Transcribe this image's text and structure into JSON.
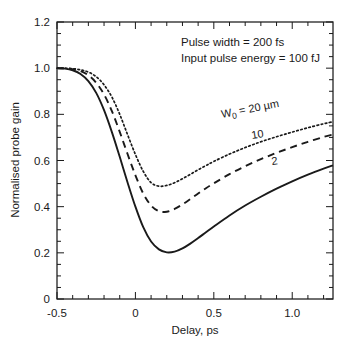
{
  "chart_data": {
    "type": "line",
    "title": "",
    "xlabel": "Delay, ps",
    "ylabel": "Normalised probe gain",
    "xlim": [
      -0.5,
      1.26
    ],
    "ylim": [
      0,
      1.2
    ],
    "xticks": [
      -0.5,
      0,
      0.5,
      1.0
    ],
    "xticklabels": [
      "-0.5",
      "0",
      "0.5",
      "1.0"
    ],
    "yticks": [
      0,
      0.2,
      0.4,
      0.6,
      0.8,
      1.0,
      1.2
    ],
    "yticklabels": [
      "0",
      "0.2",
      "0.4",
      "0.6",
      "0.8",
      "1.0",
      "1.2"
    ],
    "grid": false,
    "legend_position": "inline-curve-labels",
    "annotations": [
      "Pulse width = 200 fs",
      "Input pulse energy = 100 fJ"
    ],
    "series": [
      {
        "name": "W0 = 20 um",
        "label": "W",
        "label_sub": "0",
        "label_rest": " = 20 µm",
        "style": "dotted",
        "color": "#1a1a1a",
        "x": [
          -0.5,
          -0.45,
          -0.4,
          -0.35,
          -0.3,
          -0.25,
          -0.2,
          -0.15,
          -0.1,
          -0.05,
          0.0,
          0.05,
          0.1,
          0.15,
          0.2,
          0.25,
          0.3,
          0.35,
          0.4,
          0.45,
          0.5,
          0.6,
          0.7,
          0.8,
          0.9,
          1.0,
          1.1,
          1.2,
          1.26
        ],
        "y": [
          1.0,
          1.0,
          0.998,
          0.993,
          0.983,
          0.963,
          0.928,
          0.875,
          0.8,
          0.712,
          0.626,
          0.553,
          0.504,
          0.489,
          0.492,
          0.504,
          0.521,
          0.54,
          0.56,
          0.578,
          0.596,
          0.628,
          0.656,
          0.681,
          0.703,
          0.723,
          0.742,
          0.759,
          0.768
        ]
      },
      {
        "name": "W0 = 10 um",
        "label": "10",
        "style": "dashed",
        "color": "#1a1a1a",
        "x": [
          -0.5,
          -0.45,
          -0.4,
          -0.35,
          -0.3,
          -0.25,
          -0.2,
          -0.15,
          -0.1,
          -0.05,
          0.0,
          0.05,
          0.1,
          0.15,
          0.2,
          0.25,
          0.3,
          0.35,
          0.4,
          0.45,
          0.5,
          0.6,
          0.7,
          0.8,
          0.9,
          1.0,
          1.1,
          1.2,
          1.26
        ],
        "y": [
          1.0,
          0.999,
          0.996,
          0.987,
          0.969,
          0.937,
          0.886,
          0.814,
          0.724,
          0.628,
          0.536,
          0.457,
          0.405,
          0.38,
          0.378,
          0.39,
          0.41,
          0.433,
          0.457,
          0.48,
          0.501,
          0.541,
          0.575,
          0.606,
          0.633,
          0.658,
          0.681,
          0.702,
          0.713
        ]
      },
      {
        "name": "W0 = 2 um",
        "label": "2",
        "style": "solid",
        "color": "#1a1a1a",
        "x": [
          -0.5,
          -0.45,
          -0.4,
          -0.35,
          -0.3,
          -0.25,
          -0.2,
          -0.15,
          -0.1,
          -0.05,
          0.0,
          0.05,
          0.1,
          0.15,
          0.2,
          0.25,
          0.3,
          0.35,
          0.4,
          0.45,
          0.5,
          0.6,
          0.7,
          0.8,
          0.9,
          1.0,
          1.1,
          1.2,
          1.26
        ],
        "y": [
          1.0,
          0.998,
          0.991,
          0.975,
          0.944,
          0.893,
          0.818,
          0.723,
          0.616,
          0.505,
          0.4,
          0.311,
          0.249,
          0.215,
          0.202,
          0.205,
          0.219,
          0.24,
          0.264,
          0.289,
          0.314,
          0.362,
          0.405,
          0.443,
          0.478,
          0.51,
          0.539,
          0.565,
          0.579
        ]
      }
    ]
  },
  "curve_labels": [
    {
      "main": "W",
      "sub": "0",
      "rest": " = 20 µm"
    },
    {
      "text": "10"
    },
    {
      "text": "2"
    }
  ]
}
